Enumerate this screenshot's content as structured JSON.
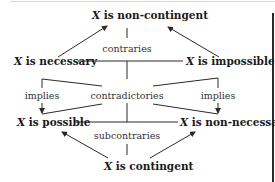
{
  "diagram": {
    "nodes": {
      "top": {
        "var": "X",
        "text": " is non-contingent"
      },
      "left_upper": {
        "var": "X",
        "text": " is necessary"
      },
      "right_upper": {
        "var": "X",
        "text": " is impossible"
      },
      "left_lower": {
        "var": "X",
        "text": " is possible"
      },
      "right_lower": {
        "var": "X",
        "text": " is non-necessary"
      },
      "bottom": {
        "var": "X",
        "text": " is contingent"
      }
    },
    "relations": {
      "contraries": "contraries",
      "contradictories": "contradictories",
      "implies_left": "implies",
      "implies_right": "implies",
      "subcontraries": "subcontraries"
    },
    "colors": {
      "line": "#2a2a2a",
      "text": "#1a1a1a"
    }
  }
}
